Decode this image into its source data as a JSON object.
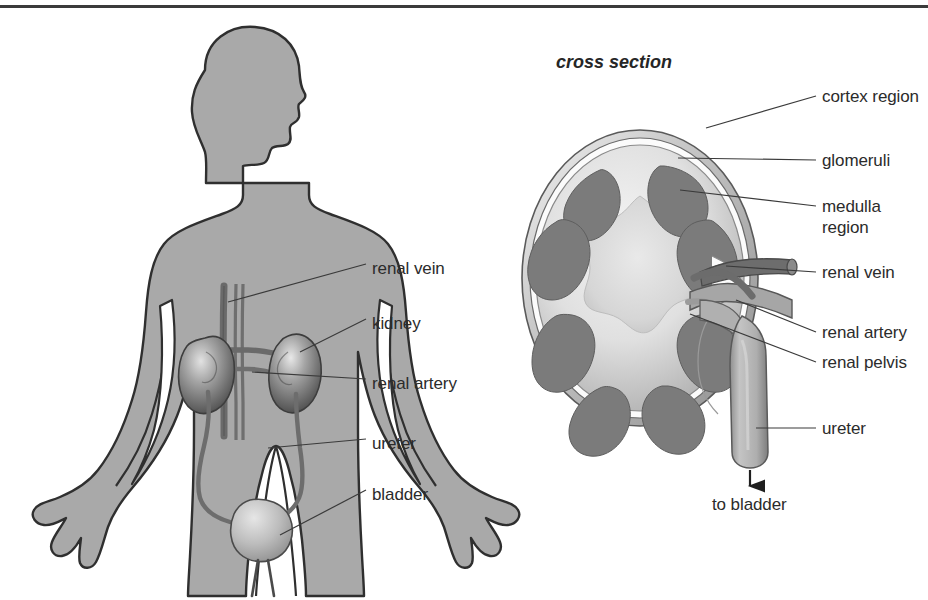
{
  "figure": {
    "title_left": "",
    "panels": {
      "left": {
        "name": "whole body urinary system",
        "labels": [
          {
            "id": "renal-vein",
            "text": "renal vein",
            "x": 372,
            "y": 268
          },
          {
            "id": "kidney",
            "text": "kidney",
            "x": 372,
            "y": 323
          },
          {
            "id": "renal-artery",
            "text": "renal artery",
            "x": 372,
            "y": 383
          },
          {
            "id": "ureter",
            "text": "ureter",
            "x": 372,
            "y": 443
          },
          {
            "id": "bladder",
            "text": "bladder",
            "x": 372,
            "y": 494
          }
        ]
      },
      "right": {
        "name": "kidney cross section",
        "title": "cross section",
        "title_x": 556,
        "title_y": 62,
        "labels": [
          {
            "id": "cortex-region",
            "text": "cortex region",
            "x": 822,
            "y": 92,
            "multiline": true
          },
          {
            "id": "glomeruli",
            "text": "glomeruli",
            "x": 822,
            "y": 156,
            "multiline": false
          },
          {
            "id": "medulla-region",
            "text": "medulla region",
            "x": 822,
            "y": 200,
            "multiline": true
          },
          {
            "id": "renal-vein-2",
            "text": "renal vein",
            "x": 822,
            "y": 268,
            "multiline": false
          },
          {
            "id": "renal-artery-2",
            "text": "renal artery",
            "x": 822,
            "y": 328,
            "multiline": false
          },
          {
            "id": "renal-pelvis",
            "text": "renal pelvis",
            "x": 822,
            "y": 358,
            "multiline": false
          },
          {
            "id": "ureter-2",
            "text": "ureter",
            "x": 822,
            "y": 424,
            "multiline": false
          }
        ],
        "flow_annotation": {
          "text": "to bladder",
          "x": 739,
          "y": 496
        }
      }
    },
    "colors": {
      "body_fill": "#a9a9a9",
      "body_outline": "#2f2f2f",
      "organ_dark": "#6f6f6f",
      "organ_mid": "#8c8c8c",
      "organ_light": "#c6c6c6",
      "pyramid": "#7b7b7b",
      "cortex": "#d2d2d2",
      "capsule": "#b4b4b4",
      "vessel": "#7a7a7a",
      "text": "#2b2b2b",
      "rule": "#3b3b3b",
      "background": "#ffffff"
    }
  }
}
